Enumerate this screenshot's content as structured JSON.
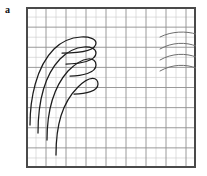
{
  "figure": {
    "panel_label": "a",
    "background_color": "#ffffff",
    "frame_color": "#4a4a4a",
    "curve_color": "#1c1c1c",
    "arc_color": "#6e6e6e",
    "grid_minor_color": "#c9c9c9",
    "grid_major_color": "#8f8f8f"
  },
  "chart_data": {
    "type": "line",
    "title": "",
    "subtitle": "",
    "xlabel": "",
    "ylabel": "",
    "xlim": [
      0,
      17
    ],
    "ylim": [
      0,
      16
    ],
    "grid": true,
    "grid_columns": 17,
    "grid_rows": 16,
    "grid_major_every_x": 2,
    "grid_major_every_y": 2,
    "legend": "none",
    "tick_labels_x": [],
    "tick_labels_y": [],
    "annotations": [
      "a"
    ],
    "series": [
      {
        "name": "hairpin-1",
        "group": "left-hairpins",
        "path": "M 4 118 C 4 92, 10 60, 28 42 C 44 26, 70 28, 70 36 C 70 44, 52 46, 36 46",
        "values": [
          [
            4,
            118
          ],
          [
            6,
            100
          ],
          [
            10,
            78
          ],
          [
            16,
            60
          ],
          [
            24,
            48
          ],
          [
            34,
            41
          ],
          [
            48,
            36
          ],
          [
            62,
            34
          ],
          [
            70,
            36
          ],
          [
            66,
            42
          ],
          [
            52,
            46
          ],
          [
            36,
            46
          ]
        ]
      },
      {
        "name": "hairpin-2",
        "group": "left-hairpins",
        "path": "M 12 126 C 12 100, 17 70, 34 52 C 50 36, 70 38, 70 46 C 70 54, 54 57, 40 57",
        "values": [
          [
            12,
            126
          ],
          [
            14,
            108
          ],
          [
            18,
            86
          ],
          [
            24,
            68
          ],
          [
            33,
            55
          ],
          [
            44,
            46
          ],
          [
            58,
            43
          ],
          [
            68,
            45
          ],
          [
            70,
            50
          ],
          [
            60,
            56
          ],
          [
            46,
            57
          ],
          [
            40,
            57
          ]
        ]
      },
      {
        "name": "hairpin-3",
        "group": "left-hairpins",
        "path": "M 21 133 C 21 108, 26 82, 42 64 C 58 48, 70 50, 70 58 C 70 66, 56 69, 44 69",
        "values": [
          [
            21,
            133
          ],
          [
            23,
            116
          ],
          [
            27,
            96
          ],
          [
            33,
            78
          ],
          [
            42,
            64
          ],
          [
            54,
            55
          ],
          [
            64,
            54
          ],
          [
            70,
            58
          ],
          [
            64,
            66
          ],
          [
            52,
            69
          ],
          [
            44,
            69
          ]
        ]
      },
      {
        "name": "hairpin-4",
        "group": "left-hairpins",
        "path": "M 30 148 C 30 118, 36 96, 52 80 C 64 68, 72 70, 72 77 C 72 84, 60 87, 48 87",
        "values": [
          [
            30,
            148
          ],
          [
            31,
            128
          ],
          [
            35,
            108
          ],
          [
            42,
            93
          ],
          [
            52,
            80
          ],
          [
            62,
            72
          ],
          [
            70,
            72
          ],
          [
            72,
            78
          ],
          [
            64,
            85
          ],
          [
            54,
            87
          ],
          [
            48,
            87
          ]
        ]
      },
      {
        "name": "arc-1",
        "group": "right-arcs",
        "path": "M 134 30 C 146 24, 160 24, 170 27",
        "values": [
          [
            134,
            30
          ],
          [
            145,
            25
          ],
          [
            158,
            24
          ],
          [
            170,
            27
          ]
        ]
      },
      {
        "name": "arc-2",
        "group": "right-arcs",
        "path": "M 134 42 C 146 35, 160 35, 170 39",
        "values": [
          [
            134,
            42
          ],
          [
            145,
            36
          ],
          [
            158,
            35
          ],
          [
            170,
            39
          ]
        ]
      },
      {
        "name": "arc-3",
        "group": "right-arcs",
        "path": "M 134 53 C 146 46, 160 46, 170 50",
        "values": [
          [
            134,
            53
          ],
          [
            145,
            47
          ],
          [
            158,
            46
          ],
          [
            170,
            50
          ]
        ]
      },
      {
        "name": "arc-4",
        "group": "right-arcs",
        "path": "M 134 64 C 146 57, 160 57, 170 61",
        "values": [
          [
            134,
            64
          ],
          [
            145,
            58
          ],
          [
            158,
            57
          ],
          [
            170,
            61
          ]
        ]
      }
    ]
  }
}
